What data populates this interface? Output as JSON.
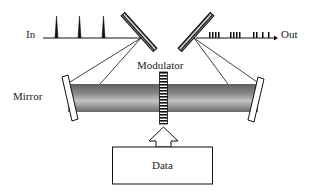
{
  "labels": {
    "input": "In",
    "output": "Out",
    "mirror": "Mirror",
    "modulator": "Modulator",
    "data": "Data"
  },
  "colors": {
    "stroke": "#111111",
    "beam_dark": "#6a6a6a",
    "beam_light": "#bdbdbd"
  }
}
